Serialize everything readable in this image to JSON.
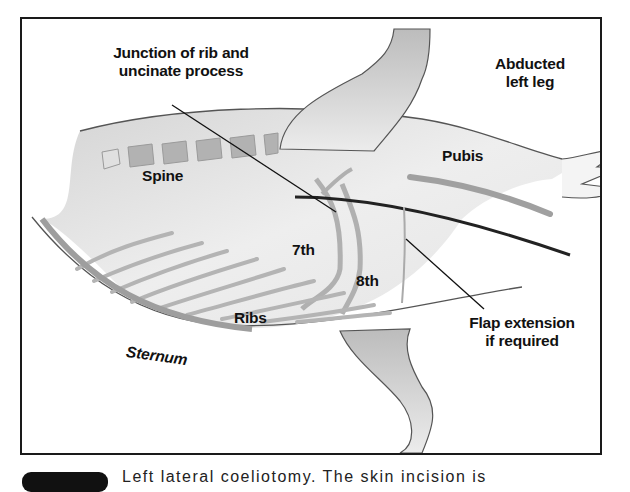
{
  "figure": {
    "labels": {
      "junction": "Junction of rib and uncinate process",
      "junction_line1": "Junction of rib and",
      "junction_line2": "uncinate process",
      "abducted_line1": "Abducted",
      "abducted_line2": "left leg",
      "pubis": "Pubis",
      "spine": "Spine",
      "seventh": "7th",
      "eighth": "8th",
      "ribs": "Ribs",
      "sternum": "Sternum",
      "flap_line1": "Flap extension",
      "flap_line2": "if required"
    },
    "colors": {
      "body_fill": "#e2e2e2",
      "leg_fill": "#c8c8c8",
      "bone": "#a8a8a8",
      "outline": "#555555",
      "incision": "#222222",
      "border": "#1a1a1a"
    }
  },
  "caption": {
    "text": "Left lateral coeliotomy. The skin incision is"
  }
}
